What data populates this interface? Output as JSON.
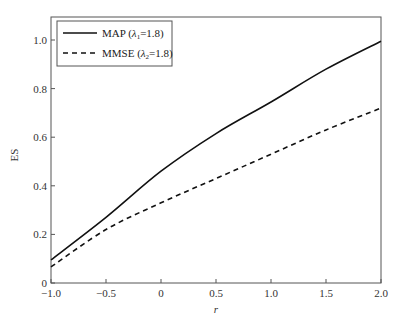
{
  "chart_data": {
    "type": "line",
    "title": "",
    "xlabel": "r",
    "ylabel": "ES",
    "xlim": [
      -1.0,
      2.0
    ],
    "ylim": [
      0,
      1.1
    ],
    "xticks": [
      -1.0,
      -0.5,
      0,
      0.5,
      1.0,
      1.5,
      2.0
    ],
    "xtick_labels": [
      "−1.0",
      "−0.5",
      "0",
      "0.5",
      "1.0",
      "1.5",
      "2.0"
    ],
    "yticks": [
      0,
      0.2,
      0.4,
      0.6,
      0.8,
      1.0
    ],
    "ytick_labels": [
      "0",
      "0.2",
      "0.4",
      "0.6",
      "0.8",
      "1.0"
    ],
    "grid": false,
    "legend_position": "upper left",
    "x": [
      -1.0,
      -0.5,
      0,
      0.5,
      1.0,
      1.5,
      2.0
    ],
    "series": [
      {
        "name": "MAP (λ1=1.8)",
        "legend_main": "MAP (",
        "legend_lambda": "λ",
        "legend_sub": "1",
        "legend_tail": "=1.8)",
        "style": "solid",
        "color": "#111111",
        "values": [
          0.095,
          0.27,
          0.46,
          0.615,
          0.745,
          0.88,
          0.995
        ]
      },
      {
        "name": "MMSE (λ2=1.8)",
        "legend_main": "MMSE (",
        "legend_lambda": "λ",
        "legend_sub": "2",
        "legend_tail": "=1.8)",
        "style": "dashed",
        "color": "#111111",
        "values": [
          0.066,
          0.22,
          0.33,
          0.43,
          0.53,
          0.63,
          0.72
        ]
      }
    ]
  }
}
